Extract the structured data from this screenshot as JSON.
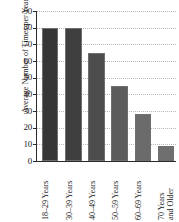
{
  "chart_data": {
    "type": "bar",
    "title": "",
    "subtitle": "",
    "xlabel": "",
    "ylabel": "Average Number of Times per Year",
    "categories": [
      "18–29 Years",
      "30–39 Years",
      "40–49 Years",
      "50–59 Years",
      "60–69 Years",
      "70 Years\nand Older"
    ],
    "values": [
      80,
      80,
      65,
      45,
      28,
      9
    ],
    "ylim": [
      0,
      90
    ],
    "ytick_labels": [
      "90",
      "80",
      "70",
      "60",
      "50",
      "40",
      "30",
      "20",
      "10",
      "0"
    ],
    "ytick_values": [
      90,
      80,
      70,
      60,
      50,
      40,
      30,
      20,
      10,
      0
    ],
    "ytick_step": 10,
    "grid": true,
    "grid_style": "dotted-horizontal",
    "legend": false,
    "legend_position": "none",
    "bar_colors": [
      "#363636",
      "#3f3f3f",
      "#4d4d4d",
      "#5c5c5c",
      "#6b6b6b",
      "#6f6f6f"
    ],
    "bar_border_color": "#6f6f6f",
    "axis_color": "#2b2b2b",
    "grid_color": "#b9b9b9",
    "text_color": "#1a1a1a",
    "background_color": "#ffffff"
  }
}
